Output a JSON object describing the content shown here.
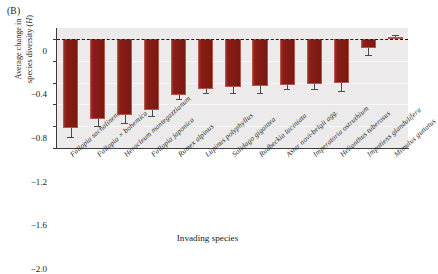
{
  "panel": {
    "label": "(B)"
  },
  "axes": {
    "ylabel_line1": "Average change in",
    "ylabel_line2_pre": "species diversity (",
    "ylabel_line2_italic": "H",
    "ylabel_line2_post": ")",
    "xlabel": "Invading species",
    "yticks": [
      "0",
      "−0.4",
      "−0.8",
      "−1.2",
      "−1.6",
      "−2.0"
    ]
  },
  "colors": {
    "bar_fill": "#8a1c16",
    "bar_edge": "#b4564a",
    "plot_background": "#eceaea",
    "gridline": "#f8f7f7",
    "axis": "#3a3a3a",
    "error_bar": "#4a4a4a"
  },
  "chart_data": {
    "type": "bar",
    "title": "",
    "xlabel": "Invading species",
    "ylabel": "Average change in species diversity (H)",
    "ylim": [
      -2.0,
      0.2
    ],
    "yticks": [
      0,
      -0.4,
      -0.8,
      -1.2,
      -1.6,
      -2.0
    ],
    "grid": true,
    "legend": "none",
    "zero_reference_line": true,
    "orientation": "vertical",
    "categories": [
      "Fallopia sachalinensis",
      "Fallopia × bohemica",
      "Heracleum mantegazzianum",
      "Fallopia japonica",
      "Rumex alpinus",
      "Lupinus polyphyllus",
      "Solidago gigantea",
      "Rudbeckia laciniata",
      "Aster novi-belgii agg.",
      "Imperatoria ostruthium",
      "Helianthus tuberosus",
      "Impatiens glandulifera",
      "Mimulus guttatus"
    ],
    "values": [
      -1.63,
      -1.47,
      -1.4,
      -1.31,
      -1.03,
      -0.92,
      -0.88,
      -0.86,
      -0.84,
      -0.83,
      -0.81,
      -0.17,
      0.03
    ],
    "errors": [
      0.17,
      0.13,
      0.15,
      0.1,
      0.08,
      0.08,
      0.11,
      0.14,
      0.08,
      0.09,
      0.14,
      0.13,
      0.04
    ]
  }
}
